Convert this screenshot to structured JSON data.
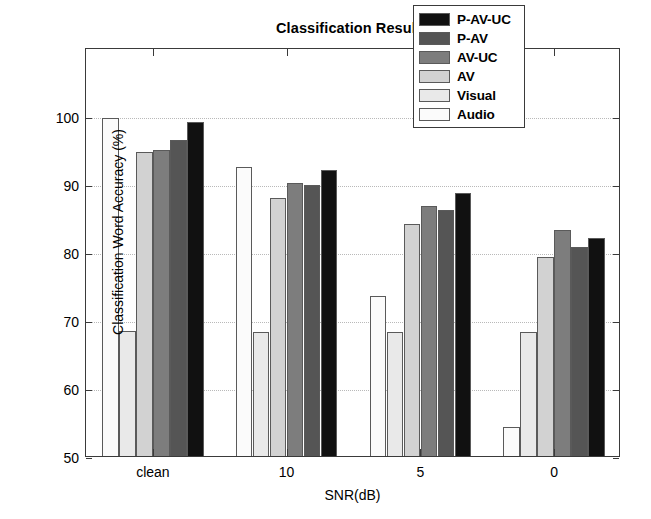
{
  "chart_data": {
    "type": "bar",
    "title": "Classification Results",
    "xlabel": "SNR(dB)",
    "ylabel": "Classification Word Accuracy (%)",
    "categories": [
      "clean",
      "10",
      "5",
      "0"
    ],
    "ylim": [
      50,
      100
    ],
    "yticks": [
      50,
      60,
      70,
      80,
      90,
      100
    ],
    "grid": true,
    "legend_position": "top-right",
    "series": [
      {
        "name": "Audio",
        "color": "#fbfbfb",
        "values": [
          100.0,
          92.8,
          73.8,
          54.5
        ]
      },
      {
        "name": "Visual",
        "color": "#e9e9e9",
        "values": [
          68.7,
          68.6,
          68.6,
          68.5
        ]
      },
      {
        "name": "AV",
        "color": "#d2d2d2",
        "values": [
          95.0,
          88.2,
          84.4,
          79.5
        ]
      },
      {
        "name": "AV-UC",
        "color": "#7d7d7d",
        "values": [
          95.3,
          90.5,
          87.0,
          83.6
        ]
      },
      {
        "name": "P-AV",
        "color": "#555555",
        "values": [
          96.8,
          90.2,
          86.5,
          81.0
        ]
      },
      {
        "name": "P-AV-UC",
        "color": "#111111",
        "values": [
          99.4,
          92.4,
          88.9,
          82.4
        ]
      }
    ],
    "legend_entries": [
      {
        "label": "P-AV-UC",
        "color": "#111111"
      },
      {
        "label": "P-AV",
        "color": "#555555"
      },
      {
        "label": "AV-UC",
        "color": "#7d7d7d"
      },
      {
        "label": "AV",
        "color": "#d2d2d2"
      },
      {
        "label": "Visual",
        "color": "#e9e9e9"
      },
      {
        "label": "Audio",
        "color": "#fbfbfb"
      }
    ]
  }
}
